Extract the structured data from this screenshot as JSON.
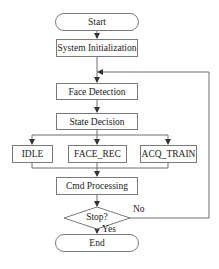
{
  "diagram": {
    "type": "flowchart",
    "nodes": {
      "start": "Start",
      "system_init": "System Initialization",
      "face_detection": "Face Detection",
      "state_decision": "State Decision",
      "idle": "IDLE",
      "face_rec": "FACE_REC",
      "acq_train": "ACQ_TRAIN",
      "cmd_processing": "Cmd Processing",
      "stop_decision": "Stop?",
      "end": "End"
    },
    "edge_labels": {
      "no": "No",
      "yes": "Yes"
    },
    "colors": {
      "line": "#6e6e6e",
      "border": "#7a7a7a",
      "text": "#1a1a1a",
      "background": "#ffffff"
    }
  }
}
